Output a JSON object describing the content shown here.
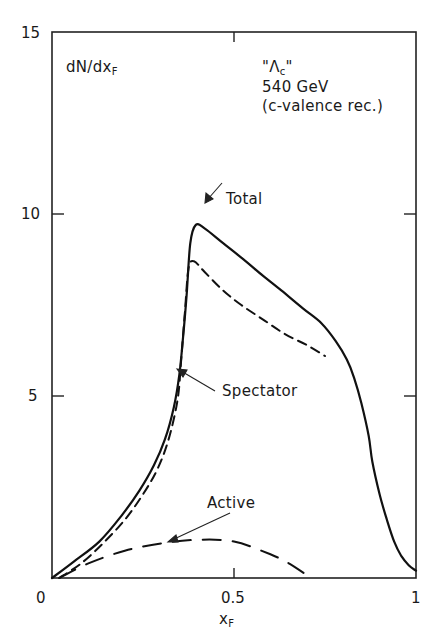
{
  "chart_data": {
    "type": "line",
    "title": "",
    "ylabel": "dN/dx_F",
    "xlabel": "x_F",
    "xlim": [
      0,
      1
    ],
    "ylim": [
      0,
      15
    ],
    "xticks": [
      0,
      0.5,
      1
    ],
    "xtick_labels": [
      "0",
      "0.5",
      "1"
    ],
    "yticks": [
      5,
      10,
      15
    ],
    "ytick_labels": [
      "5",
      "10",
      "15"
    ],
    "grid": false,
    "legend": "none (curves labelled by arrows)",
    "annotations": {
      "process_label": "\"Λc\"",
      "energy": "540 GeV",
      "mechanism": "(c-valence rec.)",
      "curve_labels": [
        "Total",
        "Spectator",
        "Active"
      ]
    },
    "series": [
      {
        "name": "Total",
        "style": "solid",
        "x": [
          0.0,
          0.06,
          0.13,
          0.19,
          0.24,
          0.28,
          0.31,
          0.335,
          0.35,
          0.36,
          0.37,
          0.38,
          0.395,
          0.42,
          0.47,
          0.52,
          0.58,
          0.63,
          0.69,
          0.74,
          0.78,
          0.81,
          0.83,
          0.85,
          0.87,
          0.88,
          0.9,
          0.92,
          0.94,
          0.96,
          0.98,
          1.0
        ],
        "y": [
          0.0,
          0.45,
          1.0,
          1.7,
          2.4,
          3.1,
          3.8,
          4.7,
          5.6,
          6.6,
          7.8,
          9.2,
          9.7,
          9.6,
          9.2,
          8.8,
          8.3,
          7.9,
          7.4,
          7.0,
          6.5,
          6.0,
          5.5,
          4.8,
          3.9,
          3.2,
          2.3,
          1.6,
          1.0,
          0.6,
          0.35,
          0.2
        ]
      },
      {
        "name": "Spectator",
        "style": "dashed",
        "x": [
          0.02,
          0.08,
          0.14,
          0.2,
          0.25,
          0.29,
          0.32,
          0.345,
          0.355,
          0.365,
          0.375,
          0.39,
          0.42,
          0.47,
          0.52,
          0.58,
          0.64,
          0.7,
          0.75
        ],
        "y": [
          0.0,
          0.4,
          0.95,
          1.6,
          2.3,
          3.0,
          3.8,
          4.9,
          6.0,
          7.3,
          8.5,
          8.7,
          8.4,
          7.9,
          7.5,
          7.1,
          6.7,
          6.4,
          6.1
        ]
      },
      {
        "name": "Active",
        "style": "long-dashed",
        "x": [
          0.02,
          0.1,
          0.2,
          0.3,
          0.4,
          0.5,
          0.6,
          0.66,
          0.71
        ],
        "y": [
          0.0,
          0.4,
          0.75,
          0.95,
          1.05,
          1.0,
          0.65,
          0.35,
          0.0
        ]
      }
    ]
  },
  "labels": {
    "ylabel_main": "dN/dx",
    "ylabel_sub": "F",
    "xlabel_main": "x",
    "xlabel_sub": "F",
    "process": "\"Λ",
    "process_sub": "c",
    "process_close": "\"",
    "energy": "540 GeV",
    "mechanism": "(c-valence rec.)",
    "total": "Total",
    "spectator": "Spectator",
    "active": "Active",
    "x0": "0",
    "x05": "0.5",
    "x1": "1",
    "y5": "5",
    "y10": "10",
    "y15": "15"
  }
}
